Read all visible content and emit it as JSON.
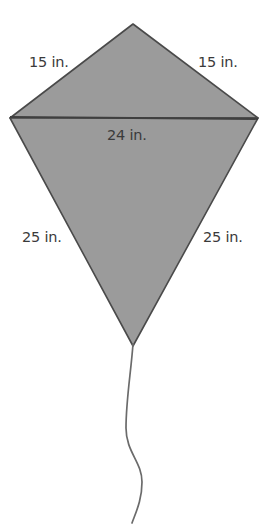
{
  "figure": {
    "name": "kite-geometry-diagram",
    "background_color": "#ffffff",
    "fill_color": "#9b9b9b",
    "stroke_color": "#4a4a4a",
    "label_color": "#3a3a3a",
    "tail_color": "#6b6b6b",
    "shape": "kite",
    "labels": {
      "top_left": "15 in.",
      "top_right": "15 in.",
      "middle": "24 in.",
      "bottom_left": "25 in.",
      "bottom_right": "25 in."
    },
    "measurements": [
      {
        "side": "upper-left",
        "value": 15,
        "unit": "in."
      },
      {
        "side": "upper-right",
        "value": 15,
        "unit": "in."
      },
      {
        "side": "horizontal-diagonal",
        "value": 24,
        "unit": "in."
      },
      {
        "side": "lower-left",
        "value": 25,
        "unit": "in."
      },
      {
        "side": "lower-right",
        "value": 25,
        "unit": "in."
      }
    ],
    "vertices": {
      "top": [
        133,
        24
      ],
      "left": [
        10,
        118
      ],
      "right": [
        258,
        118
      ],
      "bottom": [
        133,
        346
      ]
    }
  }
}
